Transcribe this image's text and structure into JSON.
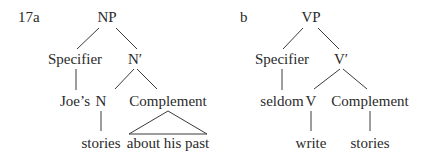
{
  "diagram": {
    "trees": [
      {
        "label": "17a",
        "root": "NP",
        "specifier": "Specifier",
        "bar": "N′",
        "specifier_word": "Joe’s",
        "head": "N",
        "complement": "Complement",
        "head_word": "stories",
        "complement_phrase": "about his past",
        "complement_shape": "triangle"
      },
      {
        "label": "b",
        "root": "VP",
        "specifier": "Specifier",
        "bar": "V′",
        "specifier_word": "seldom",
        "head": "V",
        "complement": "Complement",
        "head_word": "write",
        "complement_phrase": "stories",
        "complement_shape": "line"
      }
    ]
  }
}
